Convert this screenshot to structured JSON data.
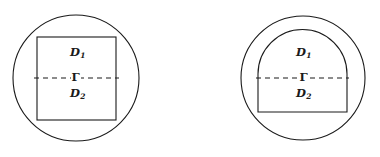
{
  "figure": {
    "caption": "",
    "background_color": "#ffffff",
    "stroke_color": "#1a1a1a",
    "panels": [
      {
        "id": "left-panel",
        "name": "square-inscribed-in-circle",
        "outer_shape": "circle",
        "inner_shape": "square",
        "labels": {
          "upper_region": "D",
          "upper_region_sub": "1",
          "interface": "Γ",
          "lower_region": "D",
          "lower_region_sub": "2"
        }
      },
      {
        "id": "right-panel",
        "name": "arch-inscribed-in-circle",
        "outer_shape": "circle",
        "inner_shape": "arch",
        "labels": {
          "upper_region": "D",
          "upper_region_sub": "1",
          "interface": "Γ",
          "lower_region": "D",
          "lower_region_sub": "2"
        }
      }
    ],
    "geometry": {
      "left_circle": {
        "cx": 76,
        "cy": 78,
        "r": 63
      },
      "left_square": {
        "x": 37,
        "y": 37,
        "width": 79,
        "height": 83
      },
      "left_interface_y": 78,
      "right_circle": {
        "cx": 303,
        "cy": 78,
        "r": 62
      },
      "right_arch": {
        "x": 258,
        "y_top": 30,
        "x_right": 347,
        "y_bottom": 112
      },
      "right_interface_y": 78
    }
  }
}
